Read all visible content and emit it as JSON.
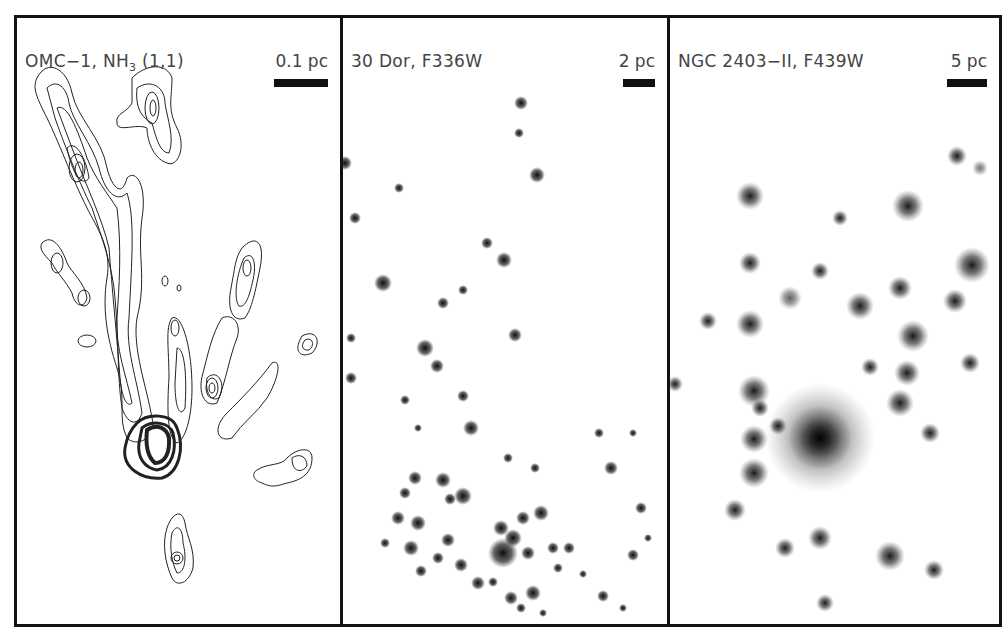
{
  "figure": {
    "panels": [
      {
        "id": "omc1",
        "title_prefix": "OMC−1, NH",
        "title_sub": "3",
        "title_suffix": " (1,1)",
        "scale_label": "0.1 pc",
        "scale_bar_px": 54,
        "image_type": "contour map"
      },
      {
        "id": "30dor",
        "title": "30 Dor, F336W",
        "scale_label": "2 pc",
        "scale_bar_px": 32,
        "image_type": "greyscale star field"
      },
      {
        "id": "ngc2403",
        "title": "NGC 2403−II, F439W",
        "scale_label": "5 pc",
        "scale_bar_px": 40,
        "image_type": "greyscale star field"
      }
    ],
    "colors": {
      "frame": "#111111",
      "background": "#ffffff",
      "text": "#444444"
    }
  }
}
